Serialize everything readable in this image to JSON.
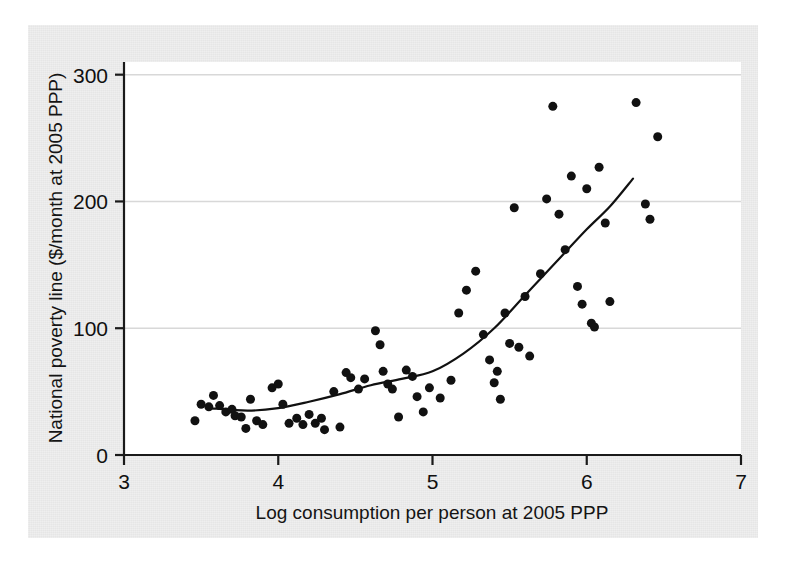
{
  "chart_data": {
    "type": "scatter",
    "title": "",
    "xlabel": "Log consumption per person at 2005 PPP",
    "ylabel": "National poverty line ($/month at 2005 PPP)",
    "xlim": [
      3,
      7
    ],
    "ylim": [
      0,
      310
    ],
    "xticks": [
      3,
      4,
      5,
      6,
      7
    ],
    "xtick_labels": [
      "3",
      "4",
      "5",
      "6",
      "7"
    ],
    "yticks": [
      0,
      100,
      200,
      300
    ],
    "ytick_labels": [
      "0",
      "100",
      "200",
      "300"
    ],
    "grid": "horizontal",
    "legend": "none",
    "marker_color": "#111111",
    "marker_size": 9,
    "line_color": "#111111",
    "series": [
      {
        "name": "Countries",
        "type": "scatter",
        "points": [
          [
            3.46,
            27
          ],
          [
            3.5,
            40
          ],
          [
            3.55,
            38
          ],
          [
            3.58,
            47
          ],
          [
            3.62,
            39
          ],
          [
            3.66,
            34
          ],
          [
            3.7,
            36
          ],
          [
            3.72,
            31
          ],
          [
            3.76,
            30
          ],
          [
            3.79,
            21
          ],
          [
            3.82,
            44
          ],
          [
            3.86,
            27
          ],
          [
            3.9,
            24
          ],
          [
            3.96,
            53
          ],
          [
            4.0,
            56
          ],
          [
            4.03,
            40
          ],
          [
            4.07,
            25
          ],
          [
            4.12,
            29
          ],
          [
            4.16,
            24
          ],
          [
            4.2,
            32
          ],
          [
            4.24,
            25
          ],
          [
            4.28,
            29
          ],
          [
            4.3,
            20
          ],
          [
            4.36,
            50
          ],
          [
            4.4,
            22
          ],
          [
            4.44,
            65
          ],
          [
            4.47,
            61
          ],
          [
            4.52,
            52
          ],
          [
            4.56,
            60
          ],
          [
            4.63,
            98
          ],
          [
            4.66,
            87
          ],
          [
            4.68,
            66
          ],
          [
            4.71,
            56
          ],
          [
            4.74,
            52
          ],
          [
            4.78,
            30
          ],
          [
            4.83,
            67
          ],
          [
            4.87,
            62
          ],
          [
            4.9,
            46
          ],
          [
            4.94,
            34
          ],
          [
            4.98,
            53
          ],
          [
            5.05,
            45
          ],
          [
            5.12,
            59
          ],
          [
            5.17,
            112
          ],
          [
            5.22,
            130
          ],
          [
            5.28,
            145
          ],
          [
            5.33,
            95
          ],
          [
            5.37,
            75
          ],
          [
            5.4,
            57
          ],
          [
            5.42,
            66
          ],
          [
            5.44,
            44
          ],
          [
            5.47,
            112
          ],
          [
            5.5,
            88
          ],
          [
            5.53,
            195
          ],
          [
            5.56,
            85
          ],
          [
            5.6,
            125
          ],
          [
            5.63,
            78
          ],
          [
            5.7,
            143
          ],
          [
            5.74,
            202
          ],
          [
            5.78,
            275
          ],
          [
            5.82,
            190
          ],
          [
            5.86,
            162
          ],
          [
            5.9,
            220
          ],
          [
            5.94,
            133
          ],
          [
            5.97,
            119
          ],
          [
            6.0,
            210
          ],
          [
            6.03,
            104
          ],
          [
            6.05,
            101
          ],
          [
            6.08,
            227
          ],
          [
            6.12,
            183
          ],
          [
            6.15,
            121
          ],
          [
            6.32,
            278
          ],
          [
            6.38,
            198
          ],
          [
            6.41,
            186
          ],
          [
            6.46,
            251
          ]
        ]
      },
      {
        "name": "Fitted curve",
        "type": "line",
        "points": [
          [
            3.55,
            37
          ],
          [
            3.8,
            35
          ],
          [
            4.0,
            37
          ],
          [
            4.2,
            42
          ],
          [
            4.4,
            48
          ],
          [
            4.6,
            55
          ],
          [
            4.8,
            60
          ],
          [
            5.0,
            66
          ],
          [
            5.2,
            80
          ],
          [
            5.4,
            100
          ],
          [
            5.6,
            126
          ],
          [
            5.8,
            152
          ],
          [
            6.0,
            178
          ],
          [
            6.15,
            196
          ],
          [
            6.3,
            218
          ]
        ]
      }
    ]
  }
}
